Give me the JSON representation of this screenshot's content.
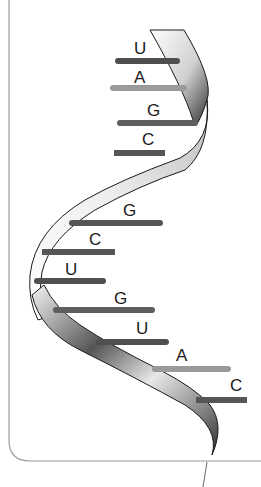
{
  "diagram": {
    "colors": {
      "frame": "#9a9a9a",
      "ribbon_outline": "#1a1a1a",
      "ribbon_light": "#f2f2f2",
      "ribbon_mid": "#bdbdbd",
      "ribbon_dark": "#3a3a3a",
      "base_U": "#4f4f4f",
      "base_A": "#9a9a9a",
      "base_G": "#5e5e5e",
      "base_C": "#555555"
    },
    "bases": [
      {
        "label": "U",
        "order": 1
      },
      {
        "label": "A",
        "order": 2
      },
      {
        "label": "G",
        "order": 3
      },
      {
        "label": "C",
        "order": 4
      },
      {
        "label": "G",
        "order": 5
      },
      {
        "label": "C",
        "order": 6
      },
      {
        "label": "U",
        "order": 7
      },
      {
        "label": "G",
        "order": 8
      },
      {
        "label": "U",
        "order": 9
      },
      {
        "label": "A",
        "order": 10
      },
      {
        "label": "C",
        "order": 11
      }
    ]
  }
}
